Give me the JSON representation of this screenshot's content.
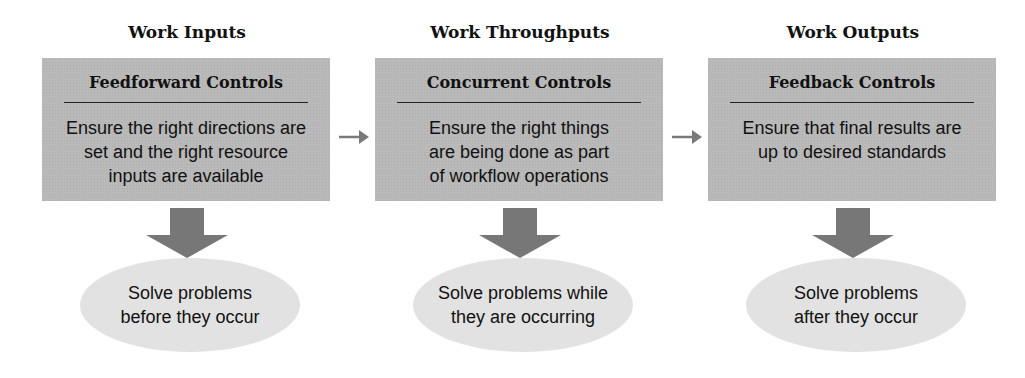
{
  "diagram": {
    "colors": {
      "box_fill": "#b9b9b9",
      "ellipse_fill": "#e2e2e2",
      "arrow_fill": "#777777",
      "connector_arrow": "#7a7a7a",
      "text": "#111111"
    },
    "stages": [
      {
        "heading": "Work Inputs",
        "box_title": "Feedforward Controls",
        "box_text": "Ensure the right directions are\nset and the right resource\ninputs are available",
        "outcome": "Solve problems\nbefore they occur"
      },
      {
        "heading": "Work Throughputs",
        "box_title": "Concurrent Controls",
        "box_text": "Ensure the right things\nare being done as part\nof workflow operations",
        "outcome": "Solve problems while\nthey are occurring"
      },
      {
        "heading": "Work Outputs",
        "box_title": "Feedback Controls",
        "box_text": "Ensure that final results are\nup to desired standards",
        "outcome": "Solve problems\nafter they occur"
      }
    ],
    "connectors": [
      {
        "from": "Feedforward Controls",
        "to": "Concurrent Controls",
        "icon": "right-arrow-icon"
      },
      {
        "from": "Concurrent Controls",
        "to": "Feedback Controls",
        "icon": "right-arrow-icon"
      }
    ]
  }
}
